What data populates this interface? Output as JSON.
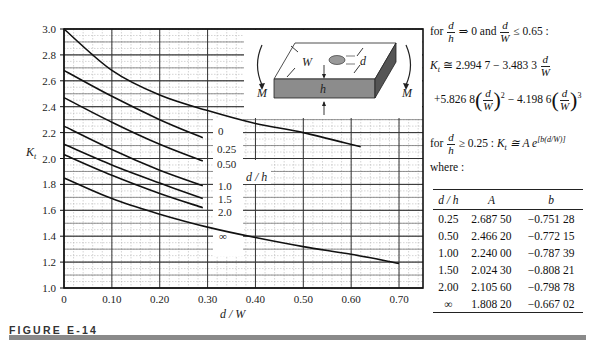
{
  "figure": {
    "label": "FIGURE E-14",
    "bar_color": "#8a8a8a"
  },
  "chart_data": {
    "type": "line",
    "title": "",
    "xlabel": "d / W",
    "ylabel": "K_t",
    "xlim": [
      0,
      0.75
    ],
    "ylim": [
      1.0,
      3.0
    ],
    "x_ticks": [
      "0",
      "0.10",
      "0.20",
      "0.30",
      "0.40",
      "0.50",
      "0.60",
      "0.70"
    ],
    "y_ticks": [
      "1.0",
      "1.2",
      "1.4",
      "1.6",
      "1.8",
      "2.0",
      "2.2",
      "2.4",
      "2.6",
      "2.8",
      "3.0"
    ],
    "grid": true,
    "legend_title": "d / h",
    "series": [
      {
        "name": "0",
        "x": [
          0,
          0.1,
          0.2,
          0.3,
          0.4,
          0.5,
          0.62
        ],
        "values": [
          3.0,
          2.68,
          2.49,
          2.37,
          2.27,
          2.2,
          2.09
        ]
      },
      {
        "name": "0.25",
        "x": [
          0,
          0.1,
          0.2,
          0.29
        ],
        "values": [
          2.68,
          2.48,
          2.3,
          2.16
        ]
      },
      {
        "name": "0.50",
        "x": [
          0,
          0.1,
          0.2,
          0.29
        ],
        "values": [
          2.47,
          2.28,
          2.11,
          1.98
        ]
      },
      {
        "name": "1.0",
        "x": [
          0,
          0.1,
          0.2,
          0.29
        ],
        "values": [
          2.25,
          2.07,
          1.91,
          1.79
        ]
      },
      {
        "name": "1.5",
        "x": [
          0,
          0.1,
          0.2,
          0.29
        ],
        "values": [
          2.11,
          1.95,
          1.81,
          1.69
        ]
      },
      {
        "name": "2.0",
        "x": [
          0,
          0.1,
          0.2,
          0.29
        ],
        "values": [
          2.03,
          1.87,
          1.73,
          1.62
        ]
      },
      {
        "name": "∞",
        "x": [
          0,
          0.1,
          0.2,
          0.3,
          0.4,
          0.5,
          0.6,
          0.7
        ],
        "values": [
          1.85,
          1.69,
          1.57,
          1.47,
          1.39,
          1.32,
          1.26,
          1.19
        ]
      }
    ],
    "annotations": [
      "M",
      "M",
      "W",
      "d",
      "h"
    ],
    "inset": "plate with central hole under bending moment M; width W, thickness h, hole diameter d"
  },
  "equations": {
    "cond1_pre": "for",
    "cond1_frac_num": "d",
    "cond1_frac_den": "h",
    "cond1_mid": "⇒ 0 and",
    "cond1_frac2_num": "d",
    "cond1_frac2_den": "W",
    "cond1_post": "≤ 0.65 :",
    "eq1_lhs": "K",
    "eq1_sub": "t",
    "eq1_rhs": "≅ 2.994 7 − 3.483 3",
    "eq1_frac_num": "d",
    "eq1_frac_den": "W",
    "eq2_a": "+5.826 8",
    "eq2_exp1": "2",
    "eq2_b": "− 4.198 6",
    "eq2_exp2": "3",
    "eq2_num": "d",
    "eq2_den": "W",
    "cond2_pre": "for",
    "cond2_num": "d",
    "cond2_den": "h",
    "cond2_post": "≥ 0.25 :",
    "eq3_lhs": "K",
    "eq3_sub": "t",
    "eq3_rhs": "≅ A e",
    "eq3_exp": "[b(d/W)]",
    "where": "where :"
  },
  "table": {
    "headers": [
      "d / h",
      "A",
      "b"
    ],
    "rows": [
      [
        "0.25",
        "2.687 50",
        "−0.751 28"
      ],
      [
        "0.50",
        "2.466 20",
        "−0.772 15"
      ],
      [
        "1.00",
        "2.240 00",
        "−0.787 39"
      ],
      [
        "1.50",
        "2.024 30",
        "−0.808 21"
      ],
      [
        "2.00",
        "2.105 60",
        "−0.798 78"
      ],
      [
        "∞",
        "1.808 20",
        "−0.667 02"
      ]
    ]
  }
}
